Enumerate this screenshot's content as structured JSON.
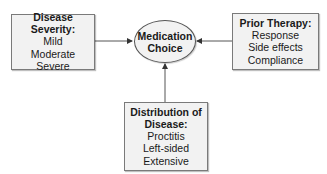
{
  "diagram": {
    "center": {
      "line1": "Medication",
      "line2": "Choice"
    },
    "left_box": {
      "title": "Disease Severity:",
      "items": [
        "Mild",
        "Moderate",
        "Severe"
      ]
    },
    "right_box": {
      "title": "Prior Therapy:",
      "items": [
        "Response",
        "Side effects",
        "Compliance"
      ]
    },
    "bottom_box": {
      "title_line1": "Distribution of",
      "title_line2": "Disease:",
      "items": [
        "Proctitis",
        "Left-sided",
        "Extensive"
      ]
    },
    "colors": {
      "box_fill": "#f2f2f2",
      "border": "#7a7a7a",
      "arrow": "#333333"
    }
  }
}
